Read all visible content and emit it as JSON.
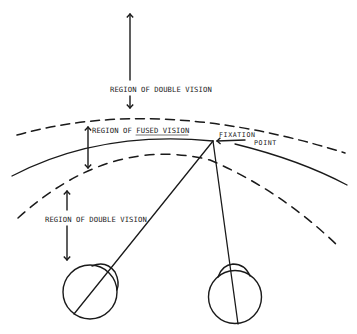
{
  "figure": {
    "type": "binocular-vision-horopter-diagram",
    "colors": {
      "ink": "#1a1a1a",
      "background": "#ffffff"
    },
    "labels": {
      "double_vision_far": "REGION OF DOUBLE VISION",
      "fused_vision": "REGION OF FUSED VISION",
      "fixation_line1": "FIXATION",
      "fixation_line2": "POINT",
      "double_vision_near": "REGION OF DOUBLE VISION"
    },
    "elements": [
      {
        "name": "outer-dashed-boundary",
        "style": "dashed"
      },
      {
        "name": "horopter-solid-curve",
        "style": "solid"
      },
      {
        "name": "inner-dashed-boundary",
        "style": "dashed"
      },
      {
        "name": "left-eye",
        "shape": "circle-with-cornea"
      },
      {
        "name": "right-eye",
        "shape": "circle-with-cornea"
      },
      {
        "name": "left-line-of-sight",
        "to": "fixation-point"
      },
      {
        "name": "right-line-of-sight",
        "to": "fixation-point"
      }
    ]
  }
}
